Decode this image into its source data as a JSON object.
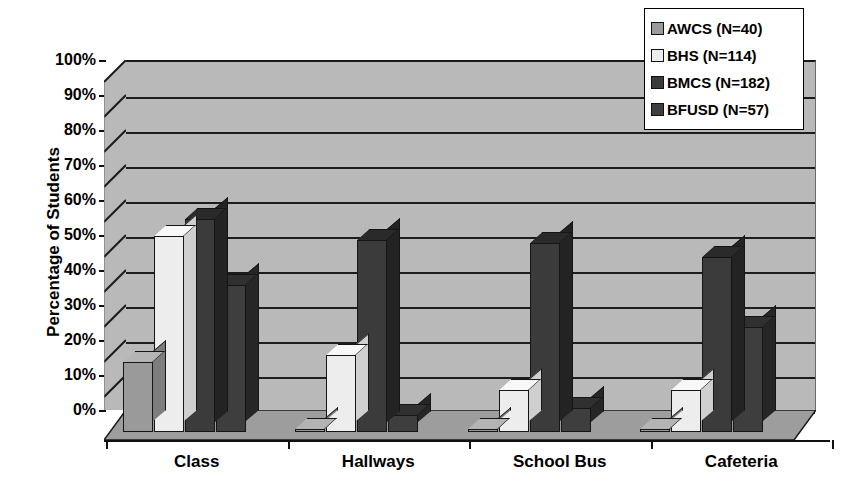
{
  "chart_data": {
    "type": "bar",
    "title": "",
    "subtitle": "",
    "xlabel": "",
    "ylabel": "Percentage of Students",
    "ylim": [
      0,
      100
    ],
    "y_tick_labels": [
      "100%",
      "90%",
      "80%",
      "70%",
      "60%",
      "50%",
      "40%",
      "30%",
      "20%",
      "10%",
      "0%"
    ],
    "y_tick_values": [
      100,
      90,
      80,
      70,
      60,
      50,
      40,
      30,
      20,
      10,
      0
    ],
    "grid": true,
    "legend_position": "top-right",
    "three_d": true,
    "categories": [
      "Class",
      "Hallways",
      "School Bus",
      "Cafeteria"
    ],
    "series": [
      {
        "name": "AWCS (N=40)",
        "key": "awcs",
        "color": "#9a9a9a",
        "values": [
          20,
          0,
          0,
          0
        ]
      },
      {
        "name": "BHS (N=114)",
        "key": "bhs",
        "color": "#ededed",
        "values": [
          56,
          22,
          12,
          12
        ]
      },
      {
        "name": "BMCS (N=182)",
        "key": "bmcs",
        "color": "#3b3b3b",
        "values": [
          61,
          55,
          54,
          50
        ]
      },
      {
        "name": "BFUSD (N=57)",
        "key": "bfusd",
        "color": "#3e3e3e",
        "values": [
          42,
          5,
          7,
          30
        ]
      }
    ]
  },
  "legend": {
    "items": [
      {
        "label": "AWCS (N=40)",
        "swatch": "#9a9a9a"
      },
      {
        "label": "BHS (N=114)",
        "swatch": "#ededed"
      },
      {
        "label": "BMCS (N=182)",
        "swatch": "#3b3b3b"
      },
      {
        "label": "BFUSD (N=57)",
        "swatch": "#3e3e3e"
      }
    ]
  },
  "axes": {
    "y_title": "Percentage of Students"
  },
  "colors": {
    "plot_background": "#b9b9b9",
    "floor": "#9d9d9d",
    "gridline": "#1d1d1d",
    "axis": "#111111",
    "page_background": "#ffffff"
  }
}
